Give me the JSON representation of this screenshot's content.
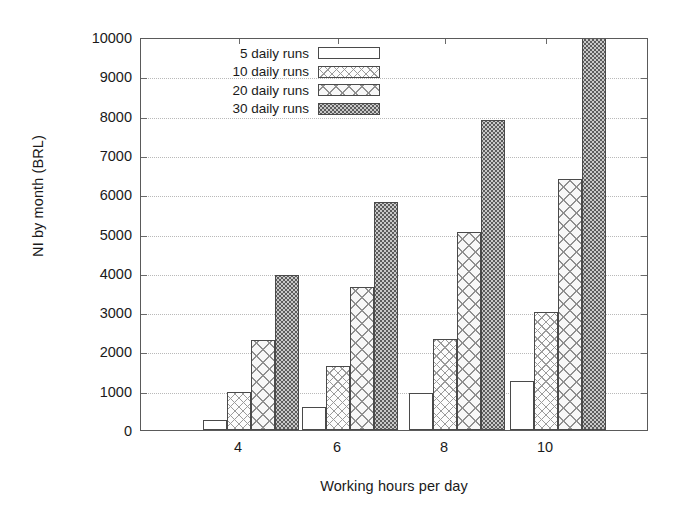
{
  "chart_data": {
    "type": "bar",
    "title": "",
    "xlabel": "Working hours per day",
    "ylabel": "NI by month (BRL)",
    "categories": [
      "4",
      "6",
      "8",
      "10"
    ],
    "xticks": [
      "4",
      "6",
      "8",
      "10"
    ],
    "yticks": [
      "0",
      "1000",
      "2000",
      "3000",
      "4000",
      "5000",
      "6000",
      "7000",
      "8000",
      "9000",
      "10000"
    ],
    "ylim": [
      0,
      10000
    ],
    "grid": true,
    "legend_position": "top-left-inside",
    "series": [
      {
        "name": "5 daily runs",
        "pattern": "plain",
        "values": [
          250,
          580,
          940,
          1250
        ]
      },
      {
        "name": "10 daily runs",
        "pattern": "cross",
        "values": [
          960,
          1620,
          2320,
          3000
        ]
      },
      {
        "name": "20 daily runs",
        "pattern": "cross2",
        "values": [
          2300,
          3650,
          5050,
          6380
        ]
      },
      {
        "name": "30 daily runs",
        "pattern": "dots",
        "values": [
          3950,
          5800,
          7880,
          10000
        ]
      }
    ]
  },
  "legend": {
    "items": [
      {
        "label": "5 daily runs"
      },
      {
        "label": "10 daily runs"
      },
      {
        "label": "20 daily runs"
      },
      {
        "label": "30 daily runs"
      }
    ]
  },
  "colors": {
    "axis": "#5a5a5a",
    "grid": "#b9b9b9",
    "bar_outline": "#4a4a4a",
    "background": "#ffffff"
  }
}
